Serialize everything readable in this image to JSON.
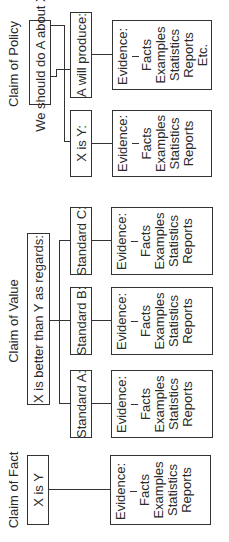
{
  "fact": {
    "title": "Claim of Fact",
    "claim": "X is Y",
    "evidence": {
      "label": "Evidence:",
      "items": [
        "Facts",
        "Examples",
        "Statistics",
        "Reports"
      ]
    }
  },
  "value": {
    "title": "Claim of Value",
    "claim": "X is better than Y as regards:",
    "standards": [
      {
        "label": "Standard A:",
        "evidence": {
          "label": "Evidence:",
          "items": [
            "Facts",
            "Examples",
            "Statistics",
            "Reports"
          ]
        }
      },
      {
        "label": "Standard B:",
        "evidence": {
          "label": "Evidence:",
          "items": [
            "Facts",
            "Examples",
            "Statistics",
            "Reports"
          ]
        }
      },
      {
        "label": "Standard C:",
        "evidence": {
          "label": "Evidence:",
          "items": [
            "Facts",
            "Examples",
            "Statistics",
            "Reports"
          ]
        }
      }
    ]
  },
  "policy": {
    "title": "Claim of Policy",
    "claim": "We should do  A about X",
    "branches": [
      {
        "label": "X is Y:",
        "evidence": {
          "label": "Evidence:",
          "items": [
            "Facts",
            "Examples",
            "Statistics",
            "Reports"
          ]
        }
      },
      {
        "label": "A will produce:",
        "evidence": {
          "label": "Evidence:",
          "items": [
            "Facts",
            "Examples",
            "Statistics",
            "Reports",
            "Etc."
          ]
        }
      }
    ]
  }
}
